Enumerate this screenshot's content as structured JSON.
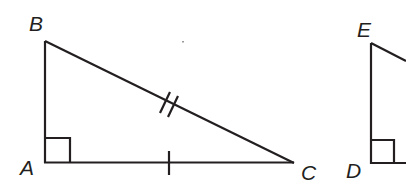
{
  "diagram": {
    "type": "geometry-congruent-right-triangles",
    "stroke_color": "#231f20",
    "background": "#ffffff",
    "triangles": [
      {
        "name": "ABC",
        "vertices": {
          "A": {
            "label": "A",
            "x": 45,
            "y": 162
          },
          "B": {
            "label": "B",
            "x": 45,
            "y": 41
          },
          "C": {
            "label": "C",
            "x": 294,
            "y": 163
          }
        },
        "right_angle_at": "A",
        "markings": [
          {
            "segment": "BC",
            "type": "double-tick"
          },
          {
            "segment": "AC",
            "type": "single-tick"
          }
        ]
      },
      {
        "name": "DEF",
        "vertices": {
          "D": {
            "label": "D",
            "x": 371,
            "y": 163
          },
          "E": {
            "label": "E",
            "x": 371,
            "y": 43
          }
        },
        "right_angle_at": "D",
        "note": "triangle partially cut off at right edge"
      }
    ],
    "labels": {
      "A": "A",
      "B": "B",
      "C": "C",
      "D": "D",
      "E": "E"
    }
  }
}
